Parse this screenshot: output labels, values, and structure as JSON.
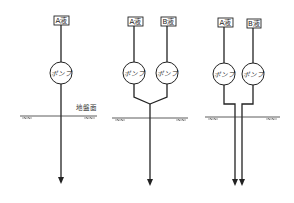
{
  "figure": {
    "colors": {
      "line": "#222222",
      "background": "#ffffff"
    },
    "ground_surface_label": "地盤面",
    "pump_label": "ポンプ",
    "panels": [
      {
        "id": "single-liquid",
        "sources": [
          {
            "label": "A液"
          }
        ],
        "pumps": [
          {
            "label": "ポンプ"
          }
        ],
        "piping": "single line to ground",
        "outlets": 1,
        "ground_label": "地盤面"
      },
      {
        "id": "two-liquid-merged",
        "sources": [
          {
            "label": "A液"
          },
          {
            "label": "B液"
          }
        ],
        "pumps": [
          {
            "label": "ポンプ"
          },
          {
            "label": "ポンプ"
          }
        ],
        "piping": "lines merge above ground into one",
        "outlets": 1
      },
      {
        "id": "two-liquid-separate",
        "sources": [
          {
            "label": "A液"
          },
          {
            "label": "B液"
          }
        ],
        "pumps": [
          {
            "label": "ポンプ"
          },
          {
            "label": "ポンプ"
          }
        ],
        "piping": "two parallel lines into ground",
        "outlets": 2
      }
    ]
  }
}
